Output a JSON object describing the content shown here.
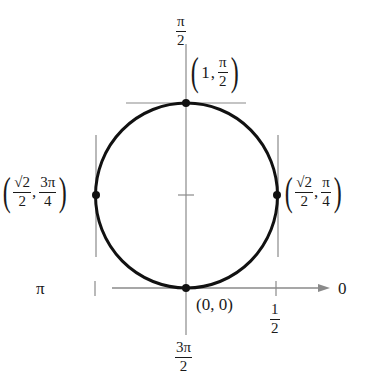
{
  "diagram": {
    "type": "polar-graph",
    "curve": "circle",
    "axis_labels": {
      "top": {
        "num": "π",
        "den": "2"
      },
      "bottom": {
        "num": "3π",
        "den": "2"
      },
      "left": "π",
      "right": "0"
    },
    "tick_label_half": {
      "num": "1",
      "den": "2"
    },
    "points": {
      "top": {
        "r": "1",
        "theta_num": "π",
        "theta_den": "2"
      },
      "left": {
        "r_num": "√2",
        "r_den": "2",
        "theta_num": "3π",
        "theta_den": "4"
      },
      "right": {
        "r_num": "√2",
        "r_den": "2",
        "theta_num": "π",
        "theta_den": "4"
      },
      "origin": "(0, 0)"
    },
    "colors": {
      "curve": "#111111",
      "axis": "#8a8a8a",
      "text": "#1a1a1a"
    }
  }
}
